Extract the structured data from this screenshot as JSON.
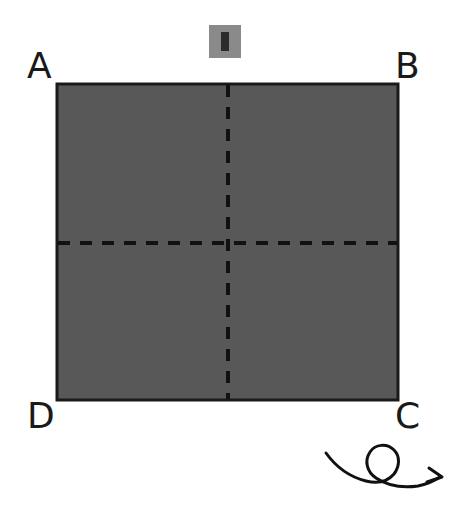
{
  "figure": {
    "background_color": "#ffffff",
    "width": 465,
    "height": 512
  },
  "shape": {
    "name": "square",
    "fill_color": "#585858",
    "stroke_color": "#1a1a1a",
    "stroke_width": 3,
    "x": 57,
    "y": 84,
    "width": 341,
    "height": 316
  },
  "fold_lines": {
    "stroke_color": "#111111",
    "stroke_width": 4,
    "dash_pattern": "12 10",
    "vertical": {
      "x": 228,
      "y1": 84,
      "y2": 400
    },
    "horizontal": {
      "y": 243,
      "x1": 57,
      "x2": 398
    }
  },
  "corner_labels": [
    {
      "id": "A",
      "text": "A",
      "position": "top-left"
    },
    {
      "id": "B",
      "text": "B",
      "position": "top-right"
    },
    {
      "id": "C",
      "text": "C",
      "position": "bottom-right"
    },
    {
      "id": "D",
      "text": "D",
      "position": "bottom-left"
    }
  ],
  "top_icon": {
    "name": "gray-tile-marker",
    "background_color": "#8a8a8a",
    "bar_color": "#2b2b2b"
  },
  "rotation_arrow": {
    "name": "looping-rotation-arrow",
    "stroke_color": "#111111",
    "stroke_width": 3,
    "direction": "rightward-loop",
    "meaning": "flip / rotate"
  }
}
